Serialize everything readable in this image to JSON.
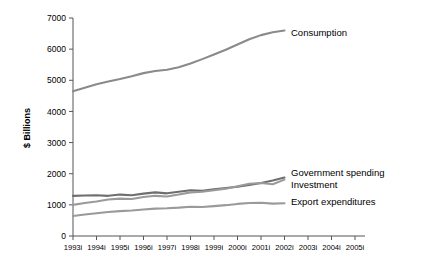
{
  "chart_data": {
    "type": "line",
    "title": "",
    "xlabel": "",
    "ylabel": "$ Billions",
    "xlim": [
      1993,
      2005
    ],
    "ylim": [
      0,
      7000
    ],
    "ytick_values": [
      0,
      1000,
      2000,
      3000,
      4000,
      5000,
      6000,
      7000
    ],
    "ytick_labels": [
      "0",
      "1000",
      "2000",
      "3000",
      "4000",
      "5000",
      "6000",
      "7000"
    ],
    "xtick_values": [
      1993,
      1994,
      1995,
      1996,
      1997,
      1998,
      1999,
      2000,
      2001,
      2002,
      2003,
      2004,
      2005
    ],
    "xtick_labels": [
      "1993i",
      "1994i",
      "1995i",
      "1996i",
      "1997i",
      "1998i",
      "1999i",
      "2000i",
      "2001i",
      "2002i",
      "2003i",
      "2004i",
      "2005i"
    ],
    "grid": false,
    "legend_position": "right-inline-labels",
    "x": [
      1993,
      1993.5,
      1994,
      1994.5,
      1995,
      1995.5,
      1996,
      1996.5,
      1997,
      1997.5,
      1998,
      1998.5,
      1999,
      1999.5,
      2000,
      2000.5,
      2001,
      2001.5,
      2002
    ],
    "series": [
      {
        "name": "Consumption",
        "color": "#8a8a8a",
        "label_color": "#000000",
        "values": [
          4650,
          4760,
          4870,
          4960,
          5040,
          5130,
          5230,
          5300,
          5340,
          5420,
          5540,
          5680,
          5830,
          5980,
          6150,
          6320,
          6450,
          6540,
          6600
        ]
      },
      {
        "name": "Government spending",
        "color": "#6e6e6e",
        "label_color": "#000000",
        "values": [
          1290,
          1300,
          1310,
          1290,
          1330,
          1310,
          1360,
          1400,
          1370,
          1420,
          1470,
          1450,
          1500,
          1540,
          1580,
          1640,
          1700,
          1780,
          1880
        ]
      },
      {
        "name": "Investment",
        "color": "#9a9a9a",
        "label_color": "#000000",
        "values": [
          1000,
          1060,
          1110,
          1170,
          1200,
          1190,
          1250,
          1290,
          1270,
          1330,
          1400,
          1420,
          1470,
          1520,
          1600,
          1680,
          1700,
          1660,
          1810
        ]
      },
      {
        "name": "Export expenditures",
        "color": "#9a9a9a",
        "label_color": "#000000",
        "values": [
          640,
          690,
          730,
          770,
          800,
          820,
          850,
          880,
          890,
          910,
          940,
          930,
          960,
          990,
          1030,
          1060,
          1070,
          1040,
          1050
        ]
      }
    ],
    "series_label_anchors": [
      {
        "name": "Consumption",
        "x": 291,
        "y": 33
      },
      {
        "name": "Government spending",
        "x": 291,
        "y": 173
      },
      {
        "name": "Investment",
        "x": 291,
        "y": 185
      },
      {
        "name": "Export expenditures",
        "x": 291,
        "y": 202
      }
    ]
  },
  "axis": {
    "y_title": "$ Billions"
  }
}
